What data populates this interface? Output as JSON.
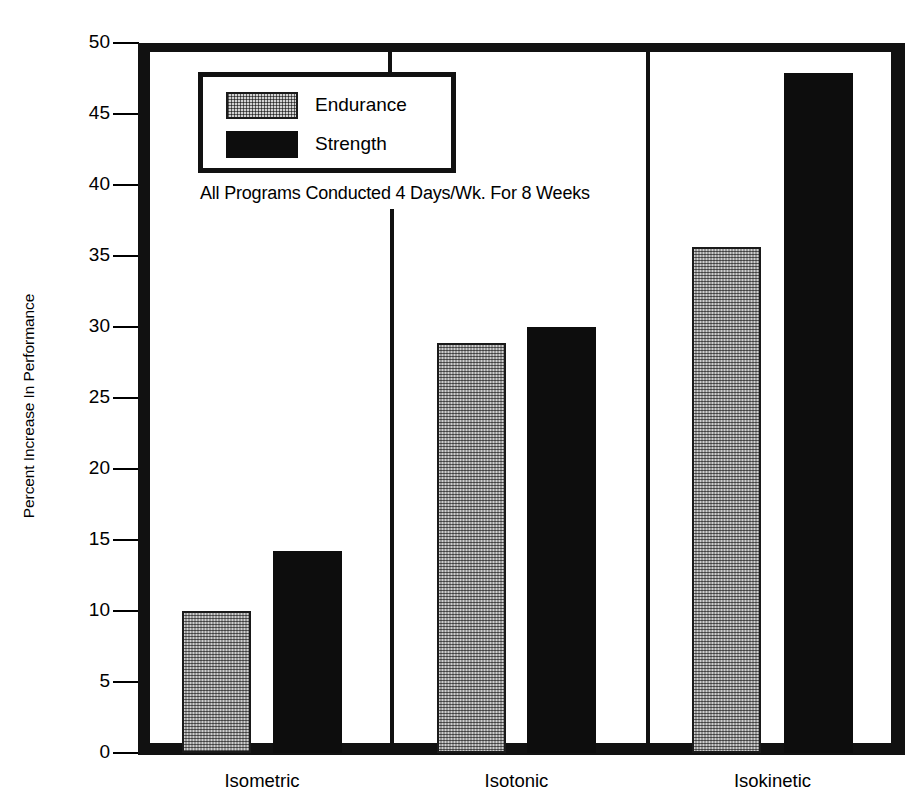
{
  "chart_data": {
    "type": "bar",
    "title": "",
    "subtitle": "",
    "xlabel": "",
    "ylabel": "Percent Increase In Performance",
    "categories": [
      "Isometric",
      "Isotonic",
      "Isokinetic"
    ],
    "series": [
      {
        "name": "Endurance",
        "values": [
          10.0,
          28.9,
          35.6
        ],
        "color": "#cfcfcf",
        "pattern": "checkered-gray"
      },
      {
        "name": "Strength",
        "values": [
          14.2,
          30.0,
          47.9
        ],
        "color": "#0d0d0d",
        "pattern": "solid-black"
      }
    ],
    "ylim": [
      0,
      50
    ],
    "ytick_values": [
      0,
      5,
      10,
      15,
      20,
      25,
      30,
      35,
      40,
      45,
      50
    ],
    "ytick_labels": [
      "0",
      "5",
      "10",
      "15",
      "20",
      "25",
      "30",
      "35",
      "40",
      "45",
      "50"
    ],
    "grid": false,
    "legend_position": "upper-left-inside",
    "annotations": [
      "All Programs Conducted 4 Days/Wk. For 8 Weeks"
    ],
    "group_separators": true
  },
  "axis": {
    "y_title": "Percent Increase In Performance"
  },
  "legend": {
    "entries": [
      {
        "label": "Endurance"
      },
      {
        "label": "Strength"
      }
    ]
  },
  "annotation": {
    "text": "All Programs Conducted 4 Days/Wk. For 8 Weeks"
  },
  "colors": {
    "endurance_fill": "#cfcfcf",
    "strength_fill": "#0d0d0d",
    "frame": "#111111",
    "background": "#ffffff"
  }
}
